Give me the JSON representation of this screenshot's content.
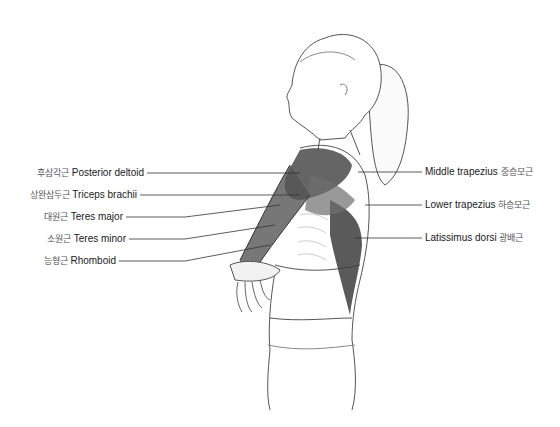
{
  "figure": {
    "colors": {
      "line": "#444444",
      "muscle_dark": "#3a3a3a",
      "muscle_mid": "#6b6b6b",
      "skin": "#ffffff",
      "leader": "#333333"
    }
  },
  "labels_left": [
    {
      "ko": "후삼각근",
      "en": "Posterior deltoid",
      "y": 173,
      "target": [
        300,
        173
      ]
    },
    {
      "ko": "상완삼두근",
      "en": "Triceps brachii",
      "y": 195,
      "target": [
        300,
        195
      ]
    },
    {
      "ko": "대원근",
      "en": "Teres major",
      "y": 217,
      "target": [
        280,
        205
      ]
    },
    {
      "ko": "소원근",
      "en": "Teres minor",
      "y": 239,
      "target": [
        275,
        225
      ]
    },
    {
      "ko": "능형근",
      "en": "Rhomboid",
      "y": 261,
      "target": [
        270,
        245
      ]
    }
  ],
  "labels_right": [
    {
      "en": "Middle trapezius",
      "ko": "중승모근",
      "y": 172,
      "target": [
        358,
        172
      ]
    },
    {
      "en": "Lower trapezius",
      "ko": "하승모근",
      "y": 205,
      "target": [
        365,
        205
      ]
    },
    {
      "en": "Latissimus dorsi",
      "ko": "광배근",
      "y": 238,
      "target": [
        355,
        238
      ]
    }
  ]
}
